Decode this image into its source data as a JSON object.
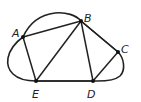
{
  "diagram": {
    "type": "graph",
    "colors": {
      "stroke": "#222222",
      "vertex": "#111111",
      "background": "#ffffff"
    },
    "vertices": [
      {
        "id": "A",
        "label": "A",
        "x": 23,
        "y": 37,
        "lx": 12,
        "ly": 37
      },
      {
        "id": "B",
        "label": "B",
        "x": 81,
        "y": 21,
        "lx": 84,
        "ly": 22
      },
      {
        "id": "C",
        "label": "C",
        "x": 118,
        "y": 52,
        "lx": 121,
        "ly": 53
      },
      {
        "id": "D",
        "label": "D",
        "x": 93,
        "y": 81,
        "lx": 87,
        "ly": 98
      },
      {
        "id": "E",
        "label": "E",
        "x": 36,
        "y": 81,
        "lx": 32,
        "ly": 98
      }
    ],
    "edges": [
      [
        "A",
        "B"
      ],
      [
        "A",
        "E"
      ],
      [
        "E",
        "B"
      ],
      [
        "B",
        "D"
      ],
      [
        "B",
        "C"
      ],
      [
        "E",
        "D"
      ],
      [
        "D",
        "C"
      ]
    ],
    "boundary_curve": "enclosing closed curve through A, B, C, D, E"
  }
}
